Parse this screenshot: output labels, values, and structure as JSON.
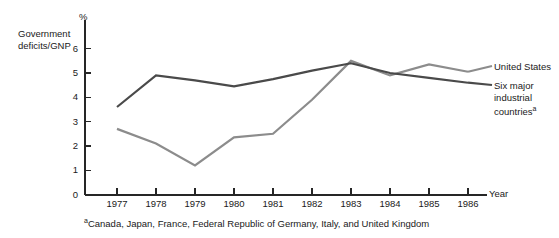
{
  "chart_data": {
    "type": "line",
    "title": "",
    "ylabel": "Government deficits/GNP",
    "yunit": "%",
    "xlabel": "Year",
    "categories": [
      "1977",
      "1978",
      "1979",
      "1980",
      "1981",
      "1982",
      "1983",
      "1984",
      "1985",
      "1986"
    ],
    "x": [
      1977,
      1978,
      1979,
      1980,
      1981,
      1982,
      1983,
      1984,
      1985,
      1986
    ],
    "ylim": [
      0,
      6.6
    ],
    "yticks": [
      0,
      1,
      2,
      3,
      4,
      5,
      6
    ],
    "ytick_labels": [
      "0",
      "1",
      "2",
      "3",
      "4",
      "5",
      "6"
    ],
    "grid": false,
    "legend_position": "right",
    "series": [
      {
        "name": "United States",
        "color": "#8c8c8c",
        "values": [
          2.7,
          2.1,
          1.2,
          2.35,
          2.5,
          3.9,
          5.5,
          4.9,
          5.35,
          5.05
        ]
      },
      {
        "name": "Six major industrial countries",
        "color": "#4a4a4a",
        "values": [
          3.6,
          4.9,
          4.7,
          4.45,
          4.75,
          5.1,
          5.4,
          5.0,
          4.8,
          4.6
        ]
      }
    ],
    "footnote_marker": "a",
    "footnote": "Canada, Japan, France, Federal Republic of Germany, Italy, and United Kingdom"
  },
  "legend": {
    "united_states": "United States",
    "six_major_line1": "Six major",
    "six_major_line2": "industrial",
    "six_major_line3": "countries",
    "six_major_superscript": "a"
  },
  "axis": {
    "y_title_line1": "Government",
    "y_title_line2": "deficits/GNP",
    "y_unit": "%",
    "x_title": "Year"
  },
  "footnote": {
    "marker": "a",
    "text": "Canada, Japan, France, Federal Republic of Germany, Italy, and United Kingdom"
  }
}
